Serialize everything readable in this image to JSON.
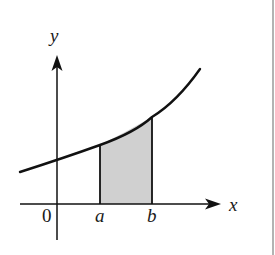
{
  "diagram": {
    "axes": {
      "x_label": "x",
      "y_label": "y",
      "origin_label": "0"
    },
    "bounds": {
      "a_label": "a",
      "b_label": "b"
    },
    "colors": {
      "stroke": "#111111",
      "shaded_region": "#d0d0d0",
      "right_border": "#9a9a9a"
    }
  }
}
